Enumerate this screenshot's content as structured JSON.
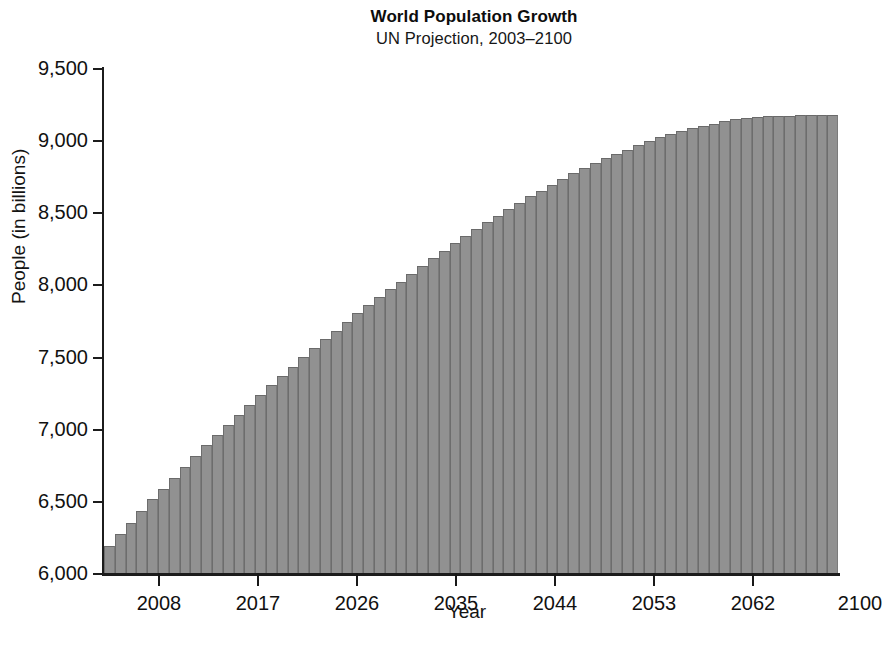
{
  "chart_data": {
    "type": "bar",
    "title": "World Population Growth",
    "subtitle": "UN Projection, 2003–2100",
    "xlabel": "Year",
    "ylabel": "People (in billions)",
    "ylim": [
      6000,
      9500
    ],
    "xlim": [
      2003,
      2100
    ],
    "grid": false,
    "legend": null,
    "bar_color": "#919191",
    "axis_color": "#1c1c1c",
    "ytick_labels": [
      "9,500",
      "9,000",
      "8,500",
      "8,000",
      "7,500",
      "7,000",
      "6,500",
      "6,000"
    ],
    "ytick_values": [
      9500,
      9000,
      8500,
      8000,
      7500,
      7000,
      6500,
      6000
    ],
    "xtick_labels": [
      "2008",
      "2017",
      "2026",
      "2035",
      "2044",
      "2053",
      "2062",
      "2100"
    ],
    "xtick_values": [
      2008,
      2017,
      2026,
      2035,
      2044,
      2053,
      2062,
      2100
    ],
    "categories": [
      2003,
      2004,
      2005,
      2006,
      2007,
      2008,
      2009,
      2010,
      2011,
      2012,
      2013,
      2014,
      2015,
      2016,
      2017,
      2018,
      2019,
      2020,
      2021,
      2022,
      2023,
      2024,
      2025,
      2026,
      2027,
      2028,
      2029,
      2030,
      2031,
      2032,
      2033,
      2034,
      2035,
      2036,
      2037,
      2038,
      2039,
      2040,
      2041,
      2042,
      2043,
      2044,
      2045,
      2046,
      2047,
      2048,
      2049,
      2050,
      2051,
      2052,
      2053,
      2054,
      2055,
      2056,
      2057,
      2058,
      2059,
      2060,
      2061,
      2062,
      2065,
      2070,
      2075,
      2080,
      2085,
      2090,
      2095,
      2100
    ],
    "values": [
      6190,
      6270,
      6350,
      6430,
      6510,
      6585,
      6660,
      6735,
      6810,
      6885,
      6955,
      7025,
      7095,
      7165,
      7235,
      7300,
      7365,
      7430,
      7495,
      7560,
      7620,
      7680,
      7740,
      7800,
      7855,
      7910,
      7965,
      8020,
      8075,
      8130,
      8185,
      8235,
      8285,
      8335,
      8385,
      8430,
      8475,
      8520,
      8565,
      8610,
      8650,
      8690,
      8730,
      8770,
      8805,
      8840,
      8875,
      8905,
      8935,
      8965,
      8995,
      9020,
      9045,
      9065,
      9085,
      9100,
      9115,
      9130,
      9145,
      9155,
      9160,
      9165,
      9168,
      9170,
      9172,
      9174,
      9175,
      9176
    ],
    "units_note": "Axis labeled “People (in billions)” with tick values 6,000–9,500"
  }
}
